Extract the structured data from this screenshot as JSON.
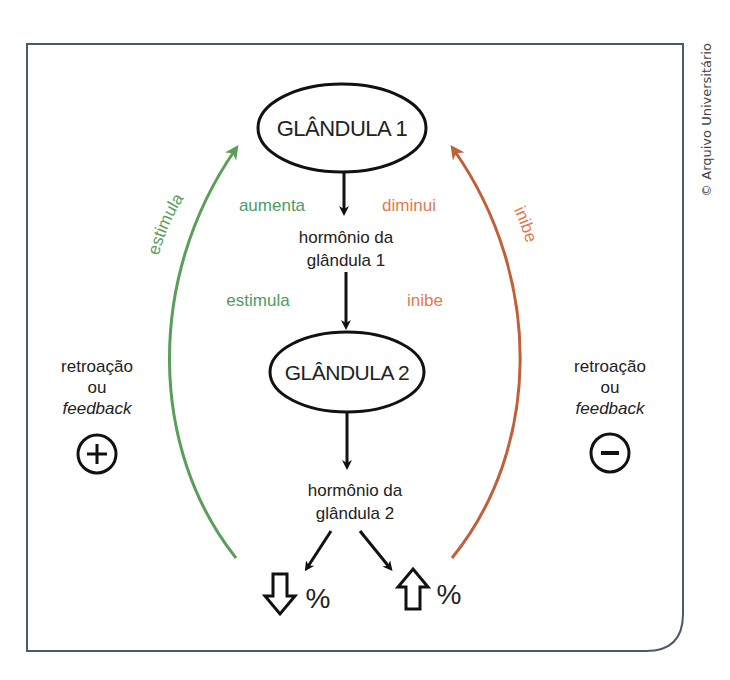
{
  "credit": "© Arquivo Universitário",
  "colors": {
    "frame": "#4a5a6e",
    "positive": "#5a9e5a",
    "positive_text": "#4e9a66",
    "negative": "#c0603a",
    "negative_text": "#e07a4e",
    "ink": "#111111"
  },
  "nodes": {
    "gland1": {
      "label": "GLÂNDULA 1"
    },
    "gland2": {
      "label": "GLÂNDULA 2"
    },
    "hormone1": {
      "line1": "hormônio da",
      "line2": "glândula 1"
    },
    "hormone2": {
      "line1": "hormônio da",
      "line2": "glândula 2"
    }
  },
  "edge_labels": {
    "increase": "aumenta",
    "decrease": "diminui",
    "stimulates": "estimula",
    "inhibits": "inibe"
  },
  "feedback": {
    "positive": {
      "arc_label": "estimula",
      "line1": "retroação",
      "line2": "ou",
      "line3": "feedback",
      "sign": "+"
    },
    "negative": {
      "arc_label": "inibe",
      "line1": "retroação",
      "line2": "ou",
      "line3": "feedback",
      "sign": "−"
    }
  },
  "outcomes": {
    "decrease": {
      "symbol": "%",
      "arrow": "down-arrow"
    },
    "increase": {
      "symbol": "%",
      "arrow": "up-arrow"
    }
  }
}
